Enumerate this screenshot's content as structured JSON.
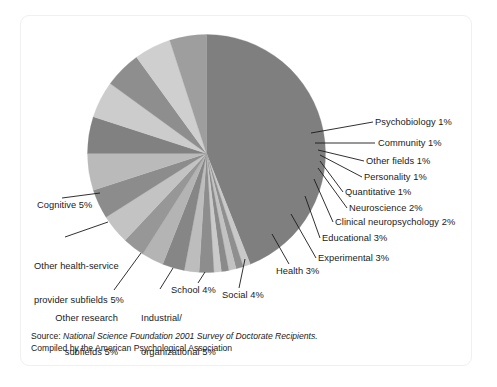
{
  "chart_data": {
    "type": "pie",
    "title": "",
    "legend_position": "callout-labels",
    "grid": false,
    "units": "percent",
    "categories": [
      "Unlabeled major subfield",
      "Psychobiology",
      "Community",
      "Other fields",
      "Personality",
      "Quantitative",
      "Neuroscience",
      "Clinical neuropsychology",
      "Educational",
      "Experimental",
      "Health",
      "Social",
      "School",
      "Industrial/organizational",
      "Other research subfields",
      "Other health-service provider subfields",
      "Cognitive",
      "Unlabeled remainder A",
      "Unlabeled remainder B"
    ],
    "values": [
      44,
      1,
      1,
      1,
      1,
      1,
      2,
      2,
      3,
      3,
      3,
      4,
      4,
      5,
      5,
      5,
      5,
      5,
      5
    ],
    "labels_shown": [
      "Psychobiology 1%",
      "Community 1%",
      "Other fields 1%",
      "Personality 1%",
      "Quantitative 1%",
      "Neuroscience 2%",
      "Clinical neuropsychology 2%",
      "Educational 3%",
      "Experimental 3%",
      "Health 3%",
      "Social 4%",
      "School 4%",
      "Industrial/organizational 5%",
      "Other research subfields 5%",
      "Other health-service provider subfields 5%",
      "Cognitive 5%"
    ],
    "slice_colors": [
      "#7f7f7f",
      "#c9c9c9",
      "#9a9a9a",
      "#bdbdbd",
      "#8a8a8a",
      "#c4c4c4",
      "#8f8f8f",
      "#b5b5b5",
      "#838383",
      "#aeaeae",
      "#949494",
      "#c0c0c0",
      "#8b8b8b",
      "#b8b8b8",
      "#808080",
      "#cdcdcd",
      "#8d8d8d",
      "#cfcfcf",
      "#9d9d9d"
    ]
  },
  "slices": [
    {
      "name": "major",
      "value": 44,
      "start": 0,
      "end": 158.4,
      "color": "#7f7f7f"
    },
    {
      "name": "psychobiology",
      "value": 1,
      "start": 158.4,
      "end": 162.0,
      "color": "#c9c9c9"
    },
    {
      "name": "community",
      "value": 1,
      "start": 162.0,
      "end": 165.6,
      "color": "#8f8f8f"
    },
    {
      "name": "other-fields",
      "value": 1,
      "start": 165.6,
      "end": 169.2,
      "color": "#c2c2c2"
    },
    {
      "name": "personality",
      "value": 1,
      "start": 169.2,
      "end": 172.8,
      "color": "#8a8a8a"
    },
    {
      "name": "quantitative",
      "value": 1,
      "start": 172.8,
      "end": 176.4,
      "color": "#cacaca"
    },
    {
      "name": "neuroscience",
      "value": 2,
      "start": 176.4,
      "end": 183.6,
      "color": "#8d8d8d"
    },
    {
      "name": "clinical-neuropsychology",
      "value": 2,
      "start": 183.6,
      "end": 190.8,
      "color": "#bdbdbd"
    },
    {
      "name": "educational",
      "value": 3,
      "start": 190.8,
      "end": 201.6,
      "color": "#868686"
    },
    {
      "name": "experimental",
      "value": 3,
      "start": 201.6,
      "end": 212.4,
      "color": "#b4b4b4"
    },
    {
      "name": "health",
      "value": 3,
      "start": 212.4,
      "end": 223.2,
      "color": "#979797"
    },
    {
      "name": "social",
      "value": 4,
      "start": 223.2,
      "end": 237.6,
      "color": "#c3c3c3"
    },
    {
      "name": "school",
      "value": 4,
      "start": 237.6,
      "end": 252.0,
      "color": "#8c8c8c"
    },
    {
      "name": "industrial-organizational",
      "value": 5,
      "start": 252.0,
      "end": 270.0,
      "color": "#bababa"
    },
    {
      "name": "other-research-subfields",
      "value": 5,
      "start": 270.0,
      "end": 288.0,
      "color": "#818181"
    },
    {
      "name": "other-health-service",
      "value": 5,
      "start": 288.0,
      "end": 306.0,
      "color": "#cccccc"
    },
    {
      "name": "cognitive",
      "value": 5,
      "start": 306.0,
      "end": 324.0,
      "color": "#8e8e8e"
    },
    {
      "name": "remainder-a",
      "value": 5,
      "start": 324.0,
      "end": 342.0,
      "color": "#cfcfcf"
    },
    {
      "name": "remainder-b",
      "value": 5,
      "start": 342.0,
      "end": 360.0,
      "color": "#9e9e9e"
    }
  ],
  "callouts": {
    "psychobiology": {
      "text": "Psychobiology 1%"
    },
    "community": {
      "text": "Community 1%"
    },
    "other_fields": {
      "text": "Other fields 1%"
    },
    "personality": {
      "text": "Personality 1%"
    },
    "quantitative": {
      "text": "Quantitative 1%"
    },
    "neuroscience": {
      "text": "Neuroscience 2%"
    },
    "clinical_neuropsychology": {
      "text": "Clinical neuropsychology 2%"
    },
    "educational": {
      "text": "Educational 3%"
    },
    "experimental": {
      "text": "Experimental 3%"
    },
    "health": {
      "text": "Health 3%"
    },
    "social": {
      "text": "Social 4%"
    },
    "school": {
      "text": "School 4%"
    },
    "industrial_line1": {
      "text": "Industrial/"
    },
    "industrial_line2": {
      "text": "organizational 5%"
    },
    "other_research_line1": {
      "text": "Other research"
    },
    "other_research_line2": {
      "text": "subfields 5%"
    },
    "other_health_line1": {
      "text": "Other health-service"
    },
    "other_health_line2": {
      "text": "provider subfields 5%"
    },
    "cognitive": {
      "text": "Cognitive 5%"
    }
  },
  "caption": {
    "source_prefix": "Source: ",
    "source_italic": "National Science Foundation 2001 Survey of Doctorate Recipients.",
    "compiled": "Compiled by the American Psychological Association"
  }
}
